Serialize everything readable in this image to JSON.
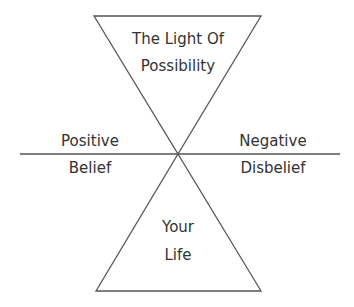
{
  "diagram": {
    "top_triangle": {
      "line1": "The Light Of",
      "line2": "Possibility"
    },
    "bottom_triangle": {
      "line1": "Your",
      "line2": "Life"
    },
    "left": {
      "above": "Positive",
      "below": "Belief"
    },
    "right": {
      "above": "Negative",
      "below": "Disbelief"
    },
    "colors": {
      "stroke": "#555555",
      "text": "#333333",
      "background": "#ffffff"
    }
  }
}
